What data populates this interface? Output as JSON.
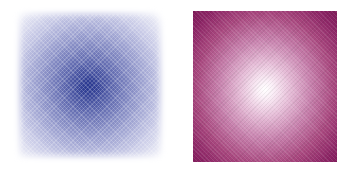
{
  "figure": {
    "panels": [
      {
        "id": "left",
        "description": "blurred square with dark blue center fading to white edges",
        "center_color": "#1f2f8a",
        "edge_color": "#e6e7f4"
      },
      {
        "id": "right",
        "description": "sharp-edged square with white center fading to magenta edges",
        "center_color": "#ffffff",
        "edge_color": "#7e1a58"
      }
    ]
  }
}
